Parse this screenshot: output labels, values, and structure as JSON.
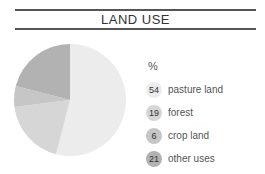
{
  "title": "LAND USE",
  "legend": {
    "unit": "%",
    "items": [
      {
        "value": "54",
        "label": "pasture land",
        "color": "#ececec"
      },
      {
        "value": "19",
        "label": "forest",
        "color": "#d6d6d6"
      },
      {
        "value": "6",
        "label": "crop land",
        "color": "#c6c6c6"
      },
      {
        "value": "21",
        "label": "other uses",
        "color": "#b2b2b2"
      }
    ]
  },
  "chart_data": {
    "type": "pie",
    "title": "LAND USE",
    "unit": "%",
    "categories": [
      "pasture land",
      "forest",
      "crop land",
      "other uses"
    ],
    "values": [
      54,
      19,
      6,
      21
    ],
    "colors": [
      "#ececec",
      "#d6d6d6",
      "#c6c6c6",
      "#b2b2b2"
    ],
    "start_angle": "12 o'clock",
    "direction": "clockwise",
    "legend_position": "right"
  }
}
